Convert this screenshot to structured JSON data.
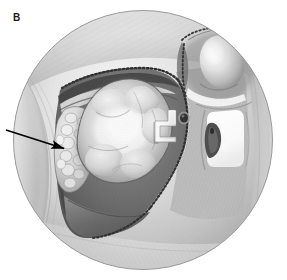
{
  "figure": {
    "panel_label": "B",
    "type": "grayscale-anatomical-illustration",
    "palette": {
      "background": "#ffffff",
      "circle_outline": "#9a9a9a",
      "field_light": "#e9e9e9",
      "field_mid": "#bdbdbd",
      "field_dark": "#8c8c8c",
      "cavity_shadow": "#6f6f6f",
      "cavity_deep": "#4f4f4f",
      "mass_highlight": "#f2f2f2",
      "mass_mid": "#cfcfcf",
      "mass_edge": "#6a6a6a",
      "granular_tissue": "#dcdcdc",
      "instrument_white": "#fdfdfd",
      "bright_window": "#fbfbfb",
      "stipple": "#2e2e2e",
      "arrow": "#000000"
    },
    "viewport": {
      "shape": "circle",
      "center_x": 143,
      "center_y": 140,
      "radius": 130
    },
    "annotations": [
      {
        "name": "pointer-arrow",
        "kind": "arrow",
        "from_x": 6,
        "from_y": 130,
        "to_x": 66,
        "to_y": 149,
        "points_to": "granular-tissue-margin"
      }
    ],
    "regions": [
      {
        "name": "endoscopic-field",
        "description": "circular endoscopic view of the surgical field"
      },
      {
        "name": "resection-cavity",
        "description": "dark open cavity with stippled cut margin"
      },
      {
        "name": "tumor-mass",
        "description": "large lobulated pale mass filling the cavity"
      },
      {
        "name": "granular-tissue-margin",
        "description": "nodular cobblestone tissue at left margin of the mass indicated by the arrow"
      },
      {
        "name": "stippled-incision-edge",
        "description": "beaded mucosal incision line bordering the cavity"
      },
      {
        "name": "retractor-instrument",
        "description": "white angular hook retractor at the right edge of the mass"
      },
      {
        "name": "suction-port",
        "description": "small dark circular opening lateral to the cavity"
      },
      {
        "name": "rounded-prominence",
        "description": "bulbous rounded structure in the upper right of the field"
      },
      {
        "name": "bright-window",
        "description": "bright white rectangular area with a dark teardrop at the right of the field"
      },
      {
        "name": "superior-recess",
        "description": "dark arched recess along the upper border of the cavity"
      },
      {
        "name": "cavity-floor",
        "description": "shaded inferior floor of the cavity"
      }
    ]
  }
}
